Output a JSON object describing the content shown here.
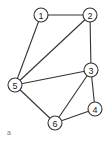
{
  "diagram": {
    "type": "undirected-graph",
    "caption": "a",
    "node_radius": 7,
    "nodes": [
      {
        "id": "1",
        "label": "1",
        "x": 41,
        "y": 15
      },
      {
        "id": "2",
        "label": "2",
        "x": 90,
        "y": 15
      },
      {
        "id": "3",
        "label": "3",
        "x": 91,
        "y": 70
      },
      {
        "id": "4",
        "label": "4",
        "x": 95,
        "y": 109
      },
      {
        "id": "5",
        "label": "5",
        "x": 15,
        "y": 85
      },
      {
        "id": "6",
        "label": "6",
        "x": 55,
        "y": 123
      }
    ],
    "edges": [
      {
        "from": "1",
        "to": "2"
      },
      {
        "from": "1",
        "to": "5"
      },
      {
        "from": "2",
        "to": "5"
      },
      {
        "from": "2",
        "to": "3"
      },
      {
        "from": "3",
        "to": "5"
      },
      {
        "from": "3",
        "to": "6"
      },
      {
        "from": "3",
        "to": "4"
      },
      {
        "from": "4",
        "to": "6"
      },
      {
        "from": "5",
        "to": "6"
      }
    ],
    "colors": {
      "stroke": "#333333",
      "fill": "#ffffff",
      "text": "#222222"
    }
  }
}
